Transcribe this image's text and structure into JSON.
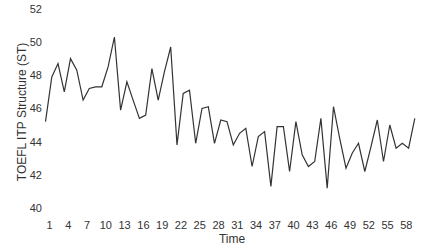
{
  "chart_data": {
    "type": "line",
    "title": "",
    "xlabel": "Time",
    "ylabel": "TOEFL ITP Structure (ST)",
    "ylim": [
      40,
      52
    ],
    "xlim": [
      1,
      60
    ],
    "grid": false,
    "legend": null,
    "y_ticks": [
      40,
      42,
      44,
      46,
      48,
      50,
      52
    ],
    "x_ticks": [
      1,
      4,
      7,
      10,
      13,
      16,
      19,
      22,
      25,
      28,
      31,
      34,
      37,
      40,
      43,
      46,
      49,
      52,
      55,
      58
    ],
    "x": [
      1,
      2,
      3,
      4,
      5,
      6,
      7,
      8,
      9,
      10,
      11,
      12,
      13,
      14,
      15,
      16,
      17,
      18,
      19,
      20,
      21,
      22,
      23,
      24,
      25,
      26,
      27,
      28,
      29,
      30,
      31,
      32,
      33,
      34,
      35,
      36,
      37,
      38,
      39,
      40,
      41,
      42,
      43,
      44,
      45,
      46,
      47,
      48,
      49,
      50,
      51,
      52,
      53,
      54,
      55,
      56,
      57,
      58,
      59,
      60
    ],
    "series": [
      {
        "name": "TOEFL ITP Structure (ST)",
        "color": "#333333",
        "values": [
          45.2,
          47.9,
          48.7,
          47.0,
          49.0,
          48.3,
          46.5,
          47.2,
          47.3,
          47.3,
          48.5,
          50.3,
          45.9,
          47.6,
          46.5,
          45.4,
          45.6,
          48.4,
          46.5,
          48.2,
          49.7,
          43.8,
          46.9,
          47.1,
          43.9,
          46.0,
          46.1,
          43.9,
          45.3,
          45.2,
          43.8,
          44.5,
          44.8,
          42.5,
          44.3,
          44.6,
          41.3,
          44.9,
          44.9,
          42.2,
          45.2,
          43.2,
          42.5,
          42.8,
          45.4,
          41.2,
          46.1,
          44.2,
          42.4,
          43.3,
          43.9,
          42.2,
          43.7,
          45.3,
          42.8,
          45.0,
          43.6,
          43.9,
          43.6,
          45.4
        ]
      }
    ]
  }
}
